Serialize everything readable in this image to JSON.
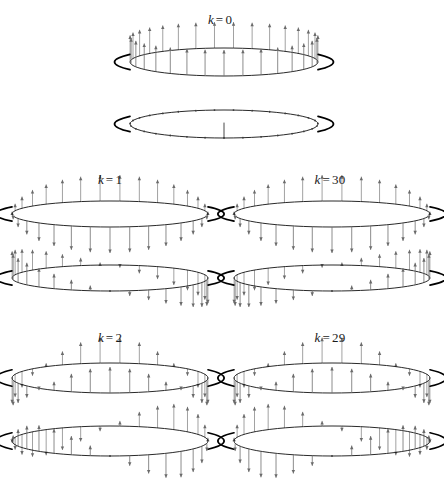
{
  "figure": {
    "title": "",
    "background_color": "#ffffff",
    "ink_color": "#000000",
    "arrow_color": "#8a8a8a",
    "width": 444,
    "height": 482
  },
  "panels": [
    {
      "id": "k0",
      "label_var": "k",
      "label_eq": "=",
      "label_num": "0",
      "label_text": "k = 0"
    },
    {
      "id": "k1",
      "label_var": "k",
      "label_eq": "=",
      "label_num": "1",
      "label_text": "k = 1"
    },
    {
      "id": "k30",
      "label_var": "k",
      "label_eq": "=",
      "label_num": "30",
      "label_text": "k = 30"
    },
    {
      "id": "k2",
      "label_var": "k",
      "label_eq": "=",
      "label_num": "2",
      "label_text": "k = 2"
    },
    {
      "id": "k29",
      "label_var": "k",
      "label_eq": "=",
      "label_num": "29",
      "label_text": "k = 29"
    }
  ],
  "chart_data": {
    "type": "line",
    "xlabel": "site index n (around the ring)",
    "ylabel": "vertical displacement",
    "n_sites": 31,
    "k_values": [
      0,
      1,
      30,
      2,
      29
    ],
    "views_per_panel": 2,
    "view_names": [
      "real part (cos)",
      "imaginary part (sin)"
    ],
    "amplitude_formula": "u_n = cos(2*pi*k*n/31) and sin(2*pi*k*n/31)",
    "series": [
      {
        "name": "k = 0, view 1 (cos)",
        "k": 0,
        "phase": "cos",
        "values": [
          1,
          1,
          1,
          1,
          1,
          1,
          1,
          1,
          1,
          1,
          1,
          1,
          1,
          1,
          1,
          1,
          1,
          1,
          1,
          1,
          1,
          1,
          1,
          1,
          1,
          1,
          1,
          1,
          1,
          1,
          1
        ]
      },
      {
        "name": "k = 0, view 2 (sin)",
        "k": 0,
        "phase": "sin",
        "values": [
          0,
          0,
          0,
          0,
          0,
          0,
          0,
          0,
          0,
          0,
          0,
          0,
          0,
          0,
          0,
          0,
          0,
          0,
          0,
          0,
          0,
          0,
          0,
          0,
          0,
          0,
          0,
          0,
          0,
          0,
          0
        ]
      },
      {
        "name": "k = 1, view 1 (cos)",
        "k": 1,
        "phase": "cos",
        "values": [
          1.0,
          0.98,
          0.92,
          0.82,
          0.69,
          0.52,
          0.33,
          0.13,
          -0.07,
          -0.27,
          -0.45,
          -0.62,
          -0.76,
          -0.88,
          -0.96,
          -1.0,
          -1.0,
          -0.96,
          -0.88,
          -0.76,
          -0.62,
          -0.45,
          -0.27,
          -0.07,
          0.13,
          0.33,
          0.52,
          0.69,
          0.82,
          0.92,
          0.98
        ]
      },
      {
        "name": "k = 1, view 2 (sin)",
        "k": 1,
        "phase": "sin",
        "values": [
          0.0,
          0.2,
          0.39,
          0.57,
          0.72,
          0.85,
          0.94,
          0.99,
          1.0,
          0.96,
          0.89,
          0.78,
          0.65,
          0.48,
          0.3,
          0.1,
          -0.1,
          -0.3,
          -0.48,
          -0.65,
          -0.78,
          -0.89,
          -0.96,
          -1.0,
          -0.99,
          -0.94,
          -0.85,
          -0.72,
          -0.57,
          -0.39,
          -0.2
        ]
      },
      {
        "name": "k = 30, view 1 (cos)",
        "k": 30,
        "phase": "cos",
        "values": [
          1.0,
          0.98,
          0.92,
          0.82,
          0.69,
          0.52,
          0.33,
          0.13,
          -0.07,
          -0.27,
          -0.45,
          -0.62,
          -0.76,
          -0.88,
          -0.96,
          -1.0,
          -1.0,
          -0.96,
          -0.88,
          -0.76,
          -0.62,
          -0.45,
          -0.27,
          -0.07,
          0.13,
          0.33,
          0.52,
          0.69,
          0.82,
          0.92,
          0.98
        ]
      },
      {
        "name": "k = 30, view 2 (sin)",
        "k": 30,
        "phase": "sin",
        "values": [
          0.0,
          -0.2,
          -0.39,
          -0.57,
          -0.72,
          -0.85,
          -0.94,
          -0.99,
          -1.0,
          -0.96,
          -0.89,
          -0.78,
          -0.65,
          -0.48,
          -0.3,
          -0.1,
          0.1,
          0.3,
          0.48,
          0.65,
          0.78,
          0.89,
          0.96,
          1.0,
          0.99,
          0.94,
          0.85,
          0.72,
          0.57,
          0.39,
          0.2
        ]
      },
      {
        "name": "k = 2, view 1 (cos)",
        "k": 2,
        "phase": "cos",
        "values": [
          1.0,
          0.92,
          0.69,
          0.33,
          -0.07,
          -0.45,
          -0.76,
          -0.96,
          -1.0,
          -0.88,
          -0.62,
          -0.27,
          0.13,
          0.52,
          0.82,
          0.98,
          0.98,
          0.82,
          0.52,
          0.13,
          -0.27,
          -0.62,
          -0.88,
          -1.0,
          -0.96,
          -0.76,
          -0.45,
          -0.07,
          0.33,
          0.69,
          0.92
        ]
      },
      {
        "name": "k = 2, view 2 (sin)",
        "k": 2,
        "phase": "sin",
        "values": [
          0.0,
          0.39,
          0.72,
          0.94,
          1.0,
          0.89,
          0.65,
          0.3,
          -0.1,
          -0.48,
          -0.78,
          -0.96,
          -0.99,
          -0.85,
          -0.57,
          -0.2,
          0.2,
          0.57,
          0.85,
          0.99,
          0.96,
          0.78,
          0.48,
          0.1,
          -0.3,
          -0.65,
          -0.89,
          -1.0,
          -0.94,
          -0.72,
          -0.39
        ]
      },
      {
        "name": "k = 29, view 1 (cos)",
        "k": 29,
        "phase": "cos",
        "values": [
          1.0,
          0.92,
          0.69,
          0.33,
          -0.07,
          -0.45,
          -0.76,
          -0.96,
          -1.0,
          -0.88,
          -0.62,
          -0.27,
          0.13,
          0.52,
          0.82,
          0.98,
          0.98,
          0.82,
          0.52,
          0.13,
          -0.27,
          -0.62,
          -0.88,
          -1.0,
          -0.96,
          -0.76,
          -0.45,
          -0.07,
          0.33,
          0.69,
          0.92
        ]
      },
      {
        "name": "k = 29, view 2 (sin)",
        "k": 29,
        "phase": "sin",
        "values": [
          0.0,
          -0.39,
          -0.72,
          -0.94,
          -1.0,
          -0.89,
          -0.65,
          -0.3,
          0.1,
          0.48,
          0.78,
          0.96,
          0.99,
          0.85,
          0.57,
          0.2,
          -0.2,
          -0.57,
          -0.85,
          -0.99,
          -0.96,
          -0.78,
          -0.48,
          -0.1,
          0.3,
          0.65,
          0.89,
          1.0,
          0.94,
          0.72,
          0.39
        ]
      }
    ],
    "grid": false,
    "legend": "none",
    "annotations": [
      "k = 0",
      "k = 1",
      "k = 30",
      "k = 2",
      "k = 29"
    ]
  },
  "layout": {
    "panel_geometry": [
      {
        "id": "k0",
        "label_x": 220,
        "label_y": 12,
        "cx": 224,
        "rx": 94,
        "ry": 14,
        "view1_cy": 62,
        "view2_cy": 124,
        "amp": 26
      },
      {
        "id": "k1",
        "label_x": 110,
        "label_y": 172,
        "cx": 110,
        "rx": 98,
        "ry": 13,
        "view1_cy": 214,
        "view2_cy": 278,
        "amp": 26
      },
      {
        "id": "k30",
        "label_x": 330,
        "label_y": 172,
        "cx": 332,
        "rx": 98,
        "ry": 13,
        "view1_cy": 214,
        "view2_cy": 278,
        "amp": 26
      },
      {
        "id": "k2",
        "label_x": 110,
        "label_y": 330,
        "cx": 110,
        "rx": 98,
        "ry": 15,
        "view1_cy": 378,
        "view2_cy": 441,
        "amp": 26
      },
      {
        "id": "k29",
        "label_x": 330,
        "label_y": 330,
        "cx": 332,
        "rx": 98,
        "ry": 15,
        "view1_cy": 378,
        "view2_cy": 441,
        "amp": 26
      }
    ]
  }
}
